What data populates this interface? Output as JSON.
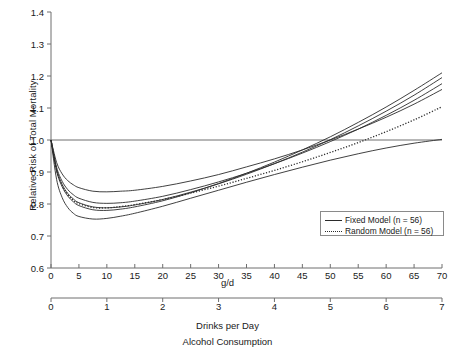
{
  "chart_data": {
    "type": "line",
    "title": "",
    "xlabel": "Alcohol Consumption",
    "ylabel": "Relative Risk of Total Mortality",
    "primary_axis": {
      "label": "g/d",
      "ticks": [
        0,
        5,
        10,
        15,
        20,
        25,
        30,
        35,
        40,
        45,
        50,
        55,
        60,
        65,
        70
      ],
      "xlim": [
        0,
        70
      ]
    },
    "secondary_axis": {
      "label": "Drinks per Day",
      "ticks": [
        0,
        1,
        2,
        3,
        4,
        5,
        6,
        7
      ],
      "xlim": [
        0,
        7
      ]
    },
    "yticks": [
      0.6,
      0.7,
      0.8,
      0.9,
      1.0,
      1.1,
      1.2,
      1.3,
      1.4
    ],
    "ylim": [
      0.6,
      1.4
    ],
    "grid": false,
    "reference_line": 1.0,
    "legend_position": "bottom-right",
    "legend": [
      {
        "label": "Fixed Model (n = 56)",
        "style": "solid"
      },
      {
        "label": "Random Model (n = 56)",
        "style": "dotted"
      }
    ],
    "x": [
      0,
      1,
      2,
      3,
      4,
      5,
      7.5,
      10,
      12.5,
      15,
      20,
      25,
      30,
      35,
      40,
      45,
      50,
      55,
      60,
      65,
      70
    ],
    "series": [
      {
        "name": "Fixed Model curve 1 (upper)",
        "style": "solid",
        "values": [
          1.0,
          0.93,
          0.894,
          0.873,
          0.86,
          0.851,
          0.84,
          0.838,
          0.84,
          0.843,
          0.855,
          0.872,
          0.892,
          0.916,
          0.941,
          0.969,
          1.0,
          1.034,
          1.071,
          1.112,
          1.158
        ]
      },
      {
        "name": "Fixed Model curve 2",
        "style": "solid",
        "values": [
          1.0,
          0.915,
          0.871,
          0.845,
          0.829,
          0.818,
          0.805,
          0.802,
          0.804,
          0.809,
          0.824,
          0.845,
          0.869,
          0.896,
          0.926,
          0.959,
          0.995,
          1.034,
          1.077,
          1.124,
          1.176
        ]
      },
      {
        "name": "Fixed Model curve 3 (central)",
        "style": "solid",
        "values": [
          1.0,
          0.908,
          0.861,
          0.833,
          0.816,
          0.804,
          0.791,
          0.788,
          0.791,
          0.797,
          0.814,
          0.837,
          0.863,
          0.893,
          0.926,
          0.962,
          1.001,
          1.044,
          1.09,
          1.14,
          1.195
        ]
      },
      {
        "name": "Fixed Model curve 4",
        "style": "solid",
        "values": [
          1.0,
          0.903,
          0.854,
          0.825,
          0.807,
          0.795,
          0.782,
          0.78,
          0.784,
          0.791,
          0.81,
          0.835,
          0.864,
          0.896,
          0.931,
          0.969,
          1.01,
          1.055,
          1.103,
          1.155,
          1.21
        ]
      },
      {
        "name": "Fixed Model curve 5 (lower)",
        "style": "solid",
        "values": [
          1.0,
          0.877,
          0.82,
          0.789,
          0.771,
          0.761,
          0.753,
          0.755,
          0.762,
          0.771,
          0.793,
          0.818,
          0.843,
          0.868,
          0.892,
          0.915,
          0.937,
          0.957,
          0.975,
          0.99,
          1.002
        ]
      },
      {
        "name": "Random Model (n = 56)",
        "style": "dotted",
        "values": [
          1.0,
          0.906,
          0.858,
          0.83,
          0.812,
          0.801,
          0.789,
          0.788,
          0.792,
          0.798,
          0.814,
          0.834,
          0.856,
          0.88,
          0.905,
          0.932,
          0.961,
          0.992,
          1.026,
          1.063,
          1.104
        ]
      }
    ]
  },
  "figure": {
    "ylabel": "Relative Risk of Total Mortality",
    "gd_label": "g/d",
    "drinks_label": "Drinks per Day",
    "alcohol_label": "Alcohol Consumption"
  },
  "legend": {
    "fixed_label": "Fixed Model (n = 56)",
    "random_label": "Random Model (n = 56)"
  },
  "colors": {
    "axis": "#6e6e6e",
    "curve": "#2b2b2b",
    "text": "#1a1a1a",
    "legend_border": "#8a8a8a"
  }
}
